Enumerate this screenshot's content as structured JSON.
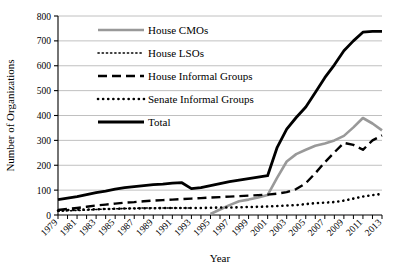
{
  "chart_data": {
    "type": "line",
    "title": "",
    "xlabel": "Year",
    "ylabel": "Number of Organizations",
    "xlim": [
      1979,
      2013
    ],
    "ylim": [
      0,
      800
    ],
    "ytick_values": [
      0,
      100,
      200,
      300,
      400,
      500,
      600,
      700,
      800
    ],
    "ytick_labels": [
      "0",
      "100",
      "200",
      "300",
      "400",
      "500",
      "600",
      "700",
      "800"
    ],
    "xtick_labels": [
      "1979",
      "1981",
      "1983",
      "1985",
      "1987",
      "1989",
      "1991",
      "1993",
      "1995",
      "1997",
      "1999",
      "2001",
      "2003",
      "2005",
      "2007",
      "2009",
      "2011",
      "2013"
    ],
    "grid": "horizontal",
    "legend_position": "upper-left-inside",
    "x": [
      1979,
      1980,
      1981,
      1982,
      1983,
      1984,
      1985,
      1986,
      1987,
      1988,
      1989,
      1990,
      1991,
      1992,
      1993,
      1994,
      1995,
      1996,
      1997,
      1998,
      1999,
      2000,
      2001,
      2002,
      2003,
      2004,
      2005,
      2006,
      2007,
      2008,
      2009,
      2010,
      2011,
      2012,
      2013
    ],
    "series": [
      {
        "name": "House CMOs",
        "color": "#999999",
        "style": "solid",
        "width": 2.6,
        "values": [
          0,
          0,
          0,
          0,
          0,
          0,
          0,
          0,
          0,
          0,
          0,
          0,
          0,
          0,
          0,
          0,
          4,
          22,
          40,
          55,
          62,
          70,
          80,
          150,
          215,
          245,
          262,
          278,
          288,
          300,
          318,
          352,
          390,
          368,
          340
        ]
      },
      {
        "name": "House LSOs",
        "color": "#000000",
        "style": "fine-dotted",
        "width": 1.6,
        "values": [
          15,
          17,
          18,
          20,
          22,
          24,
          25,
          26,
          27,
          28,
          28,
          28,
          28,
          28,
          28,
          0,
          0,
          0,
          0,
          0,
          0,
          0,
          0,
          0,
          0,
          0,
          0,
          0,
          0,
          0,
          0,
          0,
          0,
          0,
          0
        ]
      },
      {
        "name": "House Informal Groups",
        "color": "#000000",
        "style": "dashed",
        "width": 2.4,
        "values": [
          20,
          24,
          28,
          33,
          38,
          42,
          46,
          50,
          52,
          55,
          58,
          60,
          62,
          64,
          66,
          68,
          70,
          72,
          74,
          76,
          78,
          80,
          82,
          86,
          92,
          104,
          128,
          168,
          212,
          252,
          290,
          282,
          262,
          300,
          320
        ]
      },
      {
        "name": "Senate Informal Groups",
        "color": "#000000",
        "style": "thick-dotted",
        "width": 2.6,
        "values": [
          18,
          20,
          21,
          22,
          23,
          24,
          25,
          26,
          26,
          27,
          27,
          28,
          28,
          28,
          28,
          28,
          29,
          30,
          30,
          31,
          32,
          33,
          34,
          36,
          38,
          40,
          44,
          48,
          50,
          52,
          58,
          66,
          74,
          80,
          85
        ]
      },
      {
        "name": "Total",
        "color": "#000000",
        "style": "solid",
        "width": 2.8,
        "values": [
          62,
          68,
          74,
          82,
          90,
          96,
          104,
          110,
          114,
          118,
          122,
          124,
          128,
          130,
          106,
          110,
          118,
          126,
          134,
          140,
          146,
          152,
          158,
          272,
          345,
          392,
          434,
          492,
          552,
          604,
          660,
          700,
          735,
          738,
          738
        ]
      }
    ]
  }
}
